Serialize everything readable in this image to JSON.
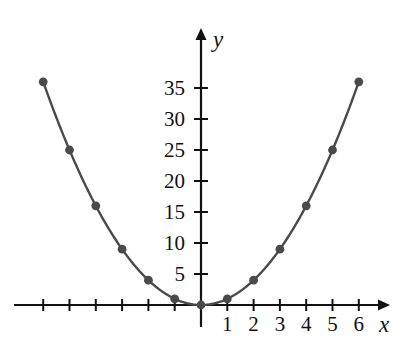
{
  "figure": {
    "background_color": "#ffffff",
    "artifact_label": "scan-edge-artifact"
  },
  "chart_data": {
    "type": "line",
    "title": "",
    "subtitle": "",
    "xlabel": "x",
    "ylabel": "y",
    "function": "y = x^2",
    "x": [
      -6,
      -5,
      -4,
      -3,
      -2,
      -1,
      0,
      1,
      2,
      3,
      4,
      5,
      6
    ],
    "values": [
      36,
      25,
      16,
      9,
      4,
      1,
      0,
      1,
      4,
      9,
      16,
      25,
      36
    ],
    "series": [
      {
        "name": "y = x^2",
        "x": [
          -6,
          -5,
          -4,
          -3,
          -2,
          -1,
          0,
          1,
          2,
          3,
          4,
          5,
          6
        ],
        "values": [
          36,
          25,
          16,
          9,
          4,
          1,
          0,
          1,
          4,
          9,
          16,
          25,
          36
        ],
        "marker": "filled-circle",
        "color": "#4a4a4a"
      }
    ],
    "xlim": [
      -7,
      7
    ],
    "ylim": [
      0,
      40
    ],
    "grid": false,
    "legend": false,
    "legend_position": "none",
    "x_ticks": [
      -6,
      -5,
      -4,
      -3,
      -2,
      -1,
      0,
      1,
      2,
      3,
      4,
      5,
      6
    ],
    "x_tick_labels": [
      "",
      "",
      "",
      "",
      "",
      "",
      "",
      "1",
      "2",
      "3",
      "4",
      "5",
      "6"
    ],
    "y_ticks": [
      5,
      10,
      15,
      20,
      25,
      30,
      35
    ],
    "y_tick_labels": [
      "5",
      "10",
      "15",
      "20",
      "25",
      "30",
      "35"
    ],
    "axis_arrows": [
      "up",
      "right"
    ],
    "colors": {
      "curve": "#4a4a4a",
      "marker": "#4a4a4a",
      "axis": "#111111",
      "text": "#111111",
      "background": "#ffffff"
    }
  },
  "axes": {
    "y_label": "y",
    "x_label": "x"
  }
}
